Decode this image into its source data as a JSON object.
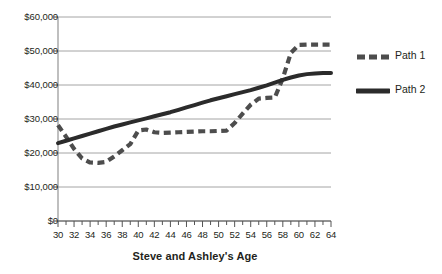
{
  "chart_data": {
    "type": "line",
    "title": "",
    "xlabel": "Steve and Ashley's Age",
    "ylabel": "",
    "xlim": [
      30,
      64
    ],
    "ylim": [
      0,
      60000
    ],
    "grid": true,
    "legend_position": "right",
    "x_tick_labels": [
      "30",
      "32",
      "34",
      "36",
      "38",
      "40",
      "42",
      "44",
      "46",
      "48",
      "50",
      "52",
      "54",
      "56",
      "58",
      "60",
      "62",
      "64"
    ],
    "y_tick_labels": [
      "$0",
      "$10,000",
      "$20,000",
      "$30,000",
      "$40,000",
      "$50,000",
      "$60,000"
    ],
    "y_tick_values": [
      0,
      10000,
      20000,
      30000,
      40000,
      50000,
      60000
    ],
    "x": [
      30,
      31,
      32,
      33,
      34,
      35,
      36,
      37,
      38,
      39,
      40,
      41,
      42,
      43,
      44,
      45,
      46,
      47,
      48,
      49,
      50,
      51,
      52,
      53,
      54,
      55,
      56,
      57,
      58,
      59,
      60,
      61,
      62,
      63,
      64
    ],
    "series": [
      {
        "name": "Path 1",
        "style": "dashed",
        "color": "#4d4d4d",
        "values": [
          28200,
          24800,
          21200,
          18400,
          17200,
          17100,
          17400,
          19000,
          20800,
          22600,
          26600,
          26900,
          26100,
          25900,
          26000,
          26100,
          26200,
          26300,
          26400,
          26400,
          26500,
          26600,
          28800,
          31600,
          34200,
          36000,
          36200,
          36300,
          42000,
          49400,
          51800,
          51900,
          51900,
          51900,
          51900
        ]
      },
      {
        "name": "Path 2",
        "style": "solid",
        "color": "#2b2b2b",
        "values": [
          22900,
          23600,
          24300,
          25000,
          25700,
          26400,
          27100,
          27800,
          28400,
          29000,
          29600,
          30200,
          30800,
          31400,
          32000,
          32700,
          33400,
          34100,
          34800,
          35500,
          36100,
          36700,
          37300,
          37900,
          38500,
          39200,
          39900,
          40700,
          41500,
          42200,
          42800,
          43200,
          43400,
          43500,
          43500
        ]
      }
    ]
  }
}
